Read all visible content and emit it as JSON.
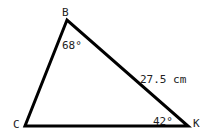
{
  "diagram": {
    "type": "triangle",
    "vertices": [
      {
        "name": "B",
        "x": 67,
        "y": 20
      },
      {
        "name": "C",
        "x": 25,
        "y": 126
      },
      {
        "name": "K",
        "x": 188,
        "y": 126
      }
    ],
    "labels": {
      "vertex_b": "B",
      "vertex_c": "C",
      "vertex_k": "K",
      "angle_b": "68°",
      "angle_k": "42°",
      "side_bk": "27.5 cm"
    },
    "stroke_color": "#000000"
  }
}
